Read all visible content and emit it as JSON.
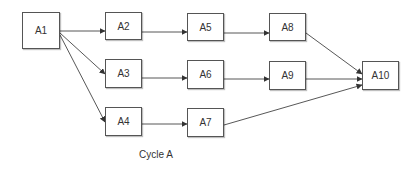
{
  "diagram": {
    "caption": "Cycle A",
    "nodes": [
      {
        "id": "A1",
        "label": "A1"
      },
      {
        "id": "A2",
        "label": "A2"
      },
      {
        "id": "A3",
        "label": "A3"
      },
      {
        "id": "A4",
        "label": "A4"
      },
      {
        "id": "A5",
        "label": "A5"
      },
      {
        "id": "A6",
        "label": "A6"
      },
      {
        "id": "A7",
        "label": "A7"
      },
      {
        "id": "A8",
        "label": "A8"
      },
      {
        "id": "A9",
        "label": "A9"
      },
      {
        "id": "A10",
        "label": "A10"
      }
    ],
    "edges": [
      [
        "A1",
        "A2"
      ],
      [
        "A1",
        "A3"
      ],
      [
        "A1",
        "A4"
      ],
      [
        "A2",
        "A5"
      ],
      [
        "A3",
        "A6"
      ],
      [
        "A4",
        "A7"
      ],
      [
        "A5",
        "A8"
      ],
      [
        "A6",
        "A9"
      ],
      [
        "A8",
        "A10"
      ],
      [
        "A9",
        "A10"
      ],
      [
        "A7",
        "A10"
      ]
    ]
  }
}
